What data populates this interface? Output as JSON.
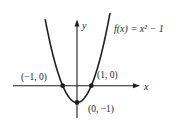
{
  "figure": {
    "background": "#ffffff",
    "ink_color": "#1f1f1f",
    "function_label": "f(x) = x² − 1",
    "axis": {
      "x_label": "x",
      "y_label": "y"
    },
    "point_labels": {
      "left_intercept": "(−1, 0)",
      "right_intercept": "(1, 0)",
      "vertex": "(0, −1)"
    }
  },
  "chart_data": {
    "type": "line",
    "equation": "f(x) = x^2 - 1",
    "coefficients": {
      "a": 1,
      "b": 0,
      "c": -1
    },
    "x_range": [
      -2.22,
      2.3
    ],
    "xlabel": "x",
    "ylabel": "y",
    "grid": false,
    "legend": false,
    "key_points": [
      {
        "label": "(−1, 0)",
        "x": -1,
        "y": 0
      },
      {
        "label": "(1, 0)",
        "x": 1,
        "y": 0
      },
      {
        "label": "(0, −1)",
        "x": 0,
        "y": -1
      }
    ],
    "annotations": [
      "f(x) = x² − 1"
    ]
  }
}
